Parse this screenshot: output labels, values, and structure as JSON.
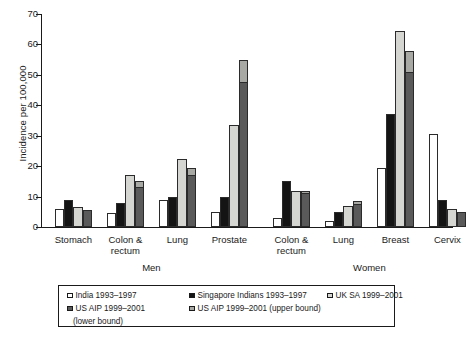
{
  "chart_data": {
    "type": "bar",
    "title": "",
    "subtitle": "",
    "xlabel": "",
    "ylabel": "Incidence per 100,000",
    "ylim": [
      0,
      70
    ],
    "yticks": [
      0,
      10,
      20,
      30,
      40,
      50,
      60,
      70
    ],
    "grid": false,
    "legend_position": "bottom",
    "group_labels": [
      "Men",
      "Women"
    ],
    "categories": [
      "Stomach",
      "Colon & rectum",
      "Lung",
      "Prostate",
      "Colon & rectum",
      "Lung",
      "Breast",
      "Cervix"
    ],
    "category_lines": [
      [
        "Stomach"
      ],
      [
        "Colon &",
        "rectum"
      ],
      [
        "Lung"
      ],
      [
        "Prostate"
      ],
      [
        "Colon &",
        "rectum"
      ],
      [
        "Lung"
      ],
      [
        "Breast"
      ],
      [
        "Cervix"
      ]
    ],
    "category_groups": [
      "Men",
      "Men",
      "Men",
      "Men",
      "Women",
      "Women",
      "Women",
      "Women"
    ],
    "series": [
      {
        "name": "India 1993–1997",
        "color": "#ffffff",
        "values": [
          6,
          4.5,
          9,
          5,
          3,
          2,
          19.5,
          30.5
        ]
      },
      {
        "name": "Singapore Indians 1993–1997",
        "color": "#141414",
        "values": [
          9,
          8,
          10,
          10,
          15,
          5,
          37,
          9
        ]
      },
      {
        "name": "UK SA 1999–2001",
        "color": "#d5d5d2",
        "values": [
          6.5,
          17,
          22.5,
          33.5,
          12,
          7,
          64.5,
          6
        ]
      },
      {
        "name": "US AIP 1999–2001 (lower bound)",
        "color": "#5a5a5a",
        "values": [
          5.5,
          13,
          17,
          47.5,
          11,
          7.5,
          51,
          5
        ]
      },
      {
        "name": "US AIP 1999–2001 (upper bound)",
        "color": "#a8a8a5",
        "values": [
          5.5,
          15,
          19.5,
          55,
          12,
          8.5,
          58,
          5
        ]
      }
    ]
  },
  "legend": {
    "items": [
      {
        "label": "India 1993–1997",
        "color": "#ffffff"
      },
      {
        "label": "Singapore Indians 1993–1997",
        "color": "#141414"
      },
      {
        "label": "UK SA 1999–2001",
        "color": "#d5d5d2"
      },
      {
        "label": "US AIP 1999–2001",
        "sublabel": "(lower bound)",
        "color": "#5a5a5a"
      },
      {
        "label": "US AIP 1999–2001 (upper bound)",
        "color": "#a8a8a5"
      }
    ]
  }
}
